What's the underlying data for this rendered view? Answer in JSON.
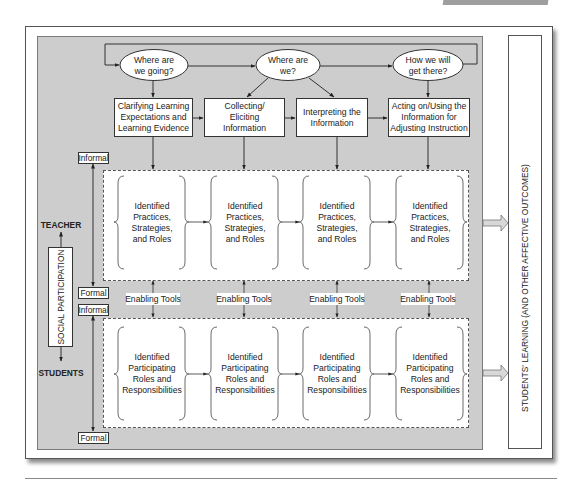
{
  "questions": [
    {
      "lines": [
        "Where are",
        "we going?"
      ]
    },
    {
      "lines": [
        "Where are",
        "we?"
      ]
    },
    {
      "lines": [
        "How we will",
        "get there?"
      ]
    }
  ],
  "steps": [
    {
      "lines": [
        "Clarifying Learning",
        "Expectations and",
        "Learning Evidence"
      ]
    },
    {
      "lines": [
        "Collecting/",
        "Eliciting",
        "Information"
      ]
    },
    {
      "lines": [
        "Interpreting the",
        "Information"
      ]
    },
    {
      "lines": [
        "Acting on/Using the",
        "Information for",
        "Adjusting Instruction"
      ]
    }
  ],
  "teacher_practices": [
    {
      "lines": [
        "Identified",
        "Practices,",
        "Strategies,",
        "and Roles"
      ]
    },
    {
      "lines": [
        "Identified",
        "Practices,",
        "Strategies,",
        "and Roles"
      ]
    },
    {
      "lines": [
        "Identified",
        "Practices,",
        "Strategies,",
        "and Roles"
      ]
    },
    {
      "lines": [
        "Identified",
        "Practices,",
        "Strategies,",
        "and Roles"
      ]
    }
  ],
  "student_roles": [
    {
      "lines": [
        "Identified",
        "Participating",
        "Roles and",
        "Responsibilities"
      ]
    },
    {
      "lines": [
        "Identified",
        "Participating",
        "Roles and",
        "Responsibilities"
      ]
    },
    {
      "lines": [
        "Identified",
        "Participating",
        "Roles and",
        "Responsibilities"
      ]
    },
    {
      "lines": [
        "Identified",
        "Participating",
        "Roles and",
        "Responsibilities"
      ]
    }
  ],
  "enabling_tools": [
    "Enabling Tools",
    "Enabling Tools",
    "Enabling Tools",
    "Enabling Tools"
  ],
  "formality": {
    "teacher_top": "Informal",
    "teacher_bottom": "Formal",
    "students_top": "Informal",
    "students_bottom": "Formal"
  },
  "social_participation": {
    "label": "SOCIAL PARTICIPATION",
    "top": "TEACHER",
    "bottom": "STUDENTS"
  },
  "outcome": "STUDENTS' LEARNING (AND OTHER AFFECTIVE OUTCOMES)",
  "colors": {
    "panel": "#cdcdcd",
    "line": "#333333",
    "box": "#ffffff"
  }
}
